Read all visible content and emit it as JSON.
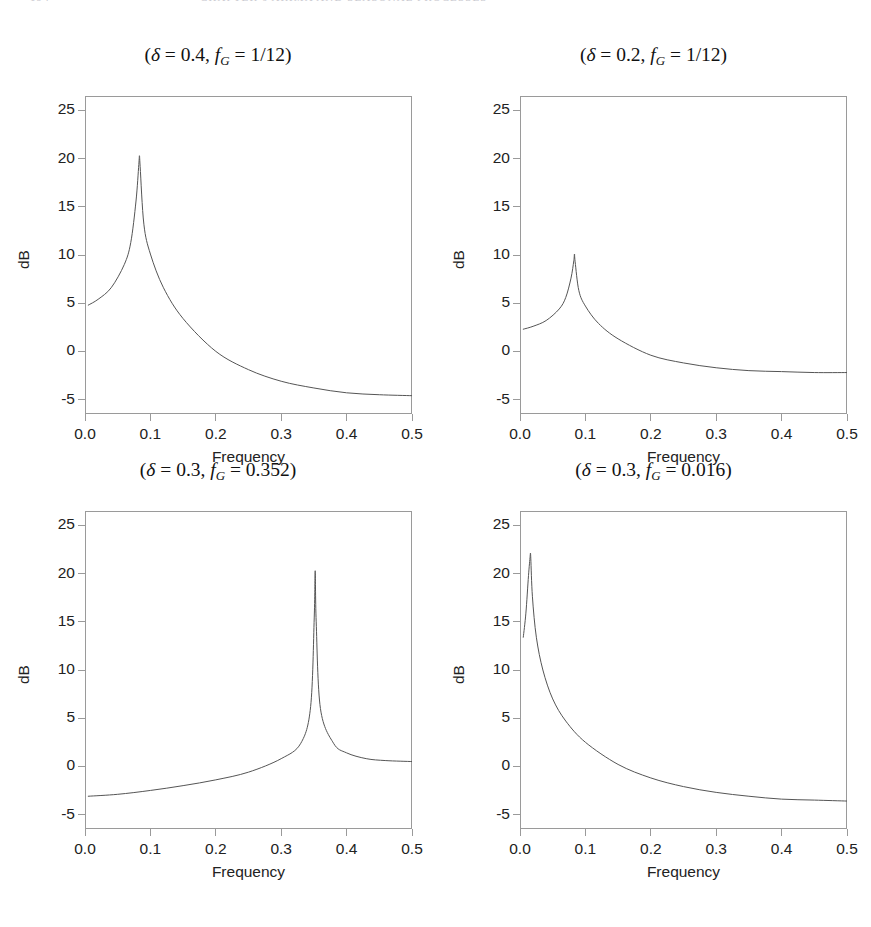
{
  "page": {
    "running_head_page": "194",
    "running_head_title": "CHAPTER 6   ARIMA AND SEASONAL PROCESSES",
    "background": "#ffffff",
    "axis_color": "#9a9a9a",
    "curve_color": "#555555"
  },
  "axes": {
    "y_ticks": [
      "25",
      "20",
      "15",
      "10",
      "5",
      "0",
      "-5"
    ],
    "y_tick_values": [
      25,
      20,
      15,
      10,
      5,
      0,
      -5
    ],
    "x_ticks": [
      "0.0",
      "0.1",
      "0.2",
      "0.3",
      "0.4",
      "0.5"
    ],
    "x_tick_values": [
      0.0,
      0.1,
      0.2,
      0.3,
      0.4,
      0.5
    ],
    "ylabel": "dB",
    "xlabel": "Frequency",
    "xlim": [
      0.0,
      0.5
    ],
    "ylim": [
      -6.5,
      26.5
    ]
  },
  "panels": [
    {
      "id": "panel-1",
      "title_prefix": "(",
      "delta_symbol": "δ",
      "title": "(δ = 0.4, f_G = 1/12)",
      "delta": "0.4",
      "fg": "1/12",
      "peak_frequency": 0.083,
      "peak_db": 20.3,
      "start_db": 4.8,
      "end_db": -4.6
    },
    {
      "id": "panel-2",
      "title": "(δ = 0.2, f_G = 1/12)",
      "delta": "0.2",
      "fg": "1/12",
      "peak_frequency": 0.083,
      "peak_db": 10.1,
      "start_db": 2.3,
      "end_db": -2.2
    },
    {
      "id": "panel-3",
      "title": "(δ = 0.3, f_G = 0.352)",
      "delta": "0.3",
      "fg": "0.352",
      "peak_frequency": 0.352,
      "peak_db": 20.3,
      "start_db": -3.1,
      "end_db": 0.5
    },
    {
      "id": "panel-4",
      "title": "(δ = 0.3, f_G = 0.016)",
      "delta": "0.3",
      "fg": "0.016",
      "peak_frequency": 0.016,
      "peak_db": 22.1,
      "start_db": 13.4,
      "end_db": -3.6
    }
  ],
  "chart_data": [
    {
      "type": "line",
      "title": "(δ = 0.4, f_G = 1/12)",
      "xlabel": "Frequency",
      "ylabel": "dB",
      "xlim": [
        0.0,
        0.5
      ],
      "ylim": [
        -6.5,
        26.5
      ],
      "grid": false,
      "legend": "none",
      "x": [
        0.005,
        0.02,
        0.04,
        0.06,
        0.07,
        0.078,
        0.0823,
        0.0833,
        0.0843,
        0.09,
        0.1,
        0.12,
        0.15,
        0.2,
        0.25,
        0.3,
        0.35,
        0.4,
        0.45,
        0.5
      ],
      "y": [
        4.8,
        5.4,
        6.6,
        9.0,
        11.3,
        15.6,
        19.4,
        20.3,
        19.2,
        13.2,
        10.1,
        6.6,
        3.4,
        0.0,
        -1.9,
        -3.1,
        -3.8,
        -4.3,
        -4.5,
        -4.6
      ]
    },
    {
      "type": "line",
      "title": "(δ = 0.2, f_G = 1/12)",
      "xlabel": "Frequency",
      "ylabel": "dB",
      "xlim": [
        0.0,
        0.5
      ],
      "ylim": [
        -6.5,
        26.5
      ],
      "grid": false,
      "legend": "none",
      "x": [
        0.005,
        0.02,
        0.04,
        0.06,
        0.07,
        0.078,
        0.0823,
        0.0833,
        0.0843,
        0.09,
        0.1,
        0.12,
        0.15,
        0.2,
        0.25,
        0.3,
        0.35,
        0.4,
        0.45,
        0.5
      ],
      "y": [
        2.3,
        2.6,
        3.2,
        4.4,
        5.6,
        7.6,
        9.4,
        10.1,
        9.3,
        6.3,
        4.7,
        2.9,
        1.3,
        -0.4,
        -1.2,
        -1.7,
        -2.0,
        -2.1,
        -2.2,
        -2.2
      ]
    },
    {
      "type": "line",
      "title": "(δ = 0.3, f_G = 0.352)",
      "xlabel": "Frequency",
      "ylabel": "dB",
      "xlim": [
        0.0,
        0.5
      ],
      "ylim": [
        -6.5,
        26.5
      ],
      "grid": false,
      "legend": "none",
      "x": [
        0.005,
        0.05,
        0.1,
        0.15,
        0.2,
        0.25,
        0.3,
        0.33,
        0.345,
        0.3505,
        0.352,
        0.3535,
        0.36,
        0.38,
        0.4,
        0.43,
        0.46,
        0.5
      ],
      "y": [
        -3.1,
        -2.9,
        -2.5,
        -2.0,
        -1.4,
        -0.6,
        0.8,
        2.4,
        6.2,
        15.4,
        20.3,
        15.0,
        6.0,
        2.4,
        1.4,
        0.8,
        0.6,
        0.5
      ]
    },
    {
      "type": "line",
      "title": "(δ = 0.3, f_G = 0.016)",
      "xlabel": "Frequency",
      "ylabel": "dB",
      "xlim": [
        0.0,
        0.5
      ],
      "ylim": [
        -6.5,
        26.5
      ],
      "grid": false,
      "legend": "none",
      "x": [
        0.005,
        0.009,
        0.013,
        0.0155,
        0.016,
        0.0165,
        0.019,
        0.025,
        0.035,
        0.05,
        0.07,
        0.1,
        0.15,
        0.2,
        0.25,
        0.3,
        0.35,
        0.4,
        0.45,
        0.5
      ],
      "y": [
        13.4,
        15.9,
        19.8,
        21.8,
        22.1,
        21.6,
        17.6,
        13.4,
        10.0,
        7.0,
        4.7,
        2.5,
        0.2,
        -1.2,
        -2.1,
        -2.7,
        -3.1,
        -3.4,
        -3.5,
        -3.6
      ]
    }
  ]
}
